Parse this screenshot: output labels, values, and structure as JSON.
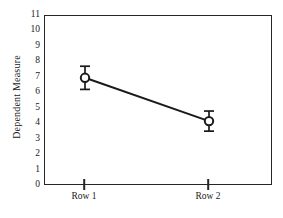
{
  "chart_data": {
    "type": "line",
    "title": "",
    "xlabel": "",
    "ylabel": "Dependent Measure",
    "categories": [
      "Row 1",
      "Row 2"
    ],
    "values": [
      7.0,
      4.2
    ],
    "errors": [
      0.75,
      0.65
    ],
    "error_type": "error-bar",
    "ylim": [
      0,
      11
    ],
    "yticks": [
      0,
      1,
      2,
      3,
      4,
      5,
      6,
      7,
      8,
      9,
      10,
      11
    ],
    "ytick_labels": [
      "0",
      "1",
      "2",
      "3",
      "4",
      "5",
      "6",
      "7",
      "8",
      "9",
      "10",
      "11"
    ],
    "grid": false,
    "legend": false,
    "marker": "open-circle",
    "line_color": "#1a1a1a",
    "marker_facecolor": "#ffffff",
    "marker_edgecolor": "#1a1a1a",
    "background_color": "#ffffff",
    "frame_color": "#262626",
    "series": [
      {
        "name": "Dependent Measure",
        "points": [
          {
            "category": "Row 1",
            "value": 7.0,
            "error": 0.75
          },
          {
            "category": "Row 2",
            "value": 4.2,
            "error": 0.65
          }
        ]
      }
    ]
  }
}
